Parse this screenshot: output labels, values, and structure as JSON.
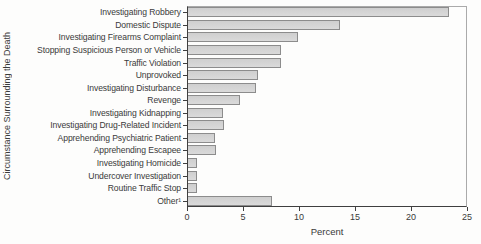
{
  "chart_data": {
    "type": "bar",
    "orientation": "horizontal",
    "title": "",
    "xlabel": "Percent",
    "ylabel": "Circumstance Surrounding the Death",
    "xlim": [
      0,
      25
    ],
    "xticks": [
      0,
      5,
      10,
      15,
      20,
      25
    ],
    "grid": false,
    "legend": false,
    "bar_color": "#d5d5d5",
    "bar_border_color": "#8c8c8c",
    "categories": [
      "Investigating Robbery",
      "Domestic Dispute",
      "Investigating Firearms Complaint",
      "Stopping Suspicious Person or Vehicle",
      "Traffic Violation",
      "Unprovoked",
      "Investigating Disturbance",
      "Revenge",
      "Investigating Kidnapping",
      "Investigating Drug-Related Incident",
      "Apprehending Psychiatric Patient",
      "Apprehending Escapee",
      "Investigating Homicide",
      "Undercover Investigation",
      "Routine Traffic Stop",
      "Other¹"
    ],
    "values": [
      23.4,
      13.7,
      9.9,
      8.4,
      8.4,
      6.3,
      6.2,
      4.7,
      3.2,
      3.3,
      2.5,
      2.6,
      0.9,
      0.9,
      0.9,
      7.6
    ]
  }
}
